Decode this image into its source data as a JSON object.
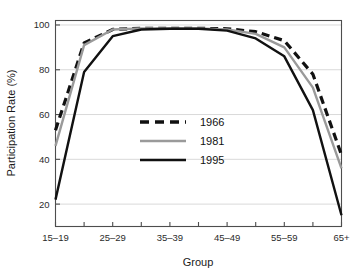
{
  "chart_data": {
    "type": "line",
    "title": "",
    "xlabel": "Group",
    "ylabel": "Participation Rate (%)",
    "x": [
      "15-19",
      "20-24",
      "25-29",
      "30-34",
      "35-39",
      "40-44",
      "45-49",
      "50-54",
      "55-59",
      "60-64",
      "65+"
    ],
    "tick_labels": [
      "15–19",
      "",
      "25–29",
      "",
      "35–39",
      "",
      "45–49",
      "",
      "55–59",
      "",
      "65+"
    ],
    "visible_tick_labels": [
      "15–19",
      "25–29",
      "35–39",
      "45–49",
      "55–59",
      "65+"
    ],
    "ylim": [
      10,
      102
    ],
    "yticks": [
      20,
      40,
      60,
      80,
      100
    ],
    "ytick_labels": [
      "20",
      "40",
      "60",
      "80",
      "100"
    ],
    "grid": "horizontal",
    "legend_position": "center",
    "series": [
      {
        "name": "1966",
        "style": "dashed",
        "color": "#111111",
        "values": [
          53,
          92,
          98,
          98.5,
          98.5,
          98.5,
          98.3,
          97,
          93,
          78,
          42
        ]
      },
      {
        "name": "1981",
        "style": "solid",
        "color": "#9a9a9a",
        "values": [
          46,
          91,
          98,
          98.5,
          98.5,
          98.5,
          98,
          96,
          90,
          72,
          36
        ]
      },
      {
        "name": "1995",
        "style": "solid",
        "color": "#111111",
        "values": [
          22,
          79,
          95,
          98,
          98.3,
          98.3,
          97.5,
          94,
          86,
          62,
          15
        ]
      }
    ]
  },
  "axes": {
    "y_axis_title": "Participation Rate (%)",
    "x_axis_title": "Group"
  },
  "legend": {
    "entries": [
      {
        "label": "1966"
      },
      {
        "label": "1981"
      },
      {
        "label": "1995"
      }
    ]
  },
  "colors": {
    "series_1966": "#111111",
    "series_1981": "#9a9a9a",
    "series_1995": "#111111",
    "grid": "#d9d9d9",
    "frame": "#4d4d4d",
    "background": "#ffffff"
  }
}
